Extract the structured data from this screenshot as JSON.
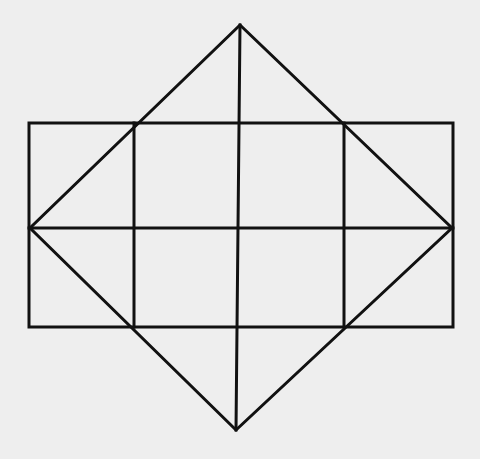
{
  "diagram": {
    "type": "geometric-figure",
    "colors": {
      "background": "#eeeeee",
      "stroke": "#111111"
    },
    "rectangle": {
      "x1": 29,
      "y1": 123,
      "x2": 453,
      "y2": 327
    },
    "grid_verticals": [
      134,
      237,
      344
    ],
    "midline_y": 228,
    "diamond": {
      "top": [
        240,
        25
      ],
      "right": [
        452,
        228
      ],
      "bottom": [
        236,
        430
      ],
      "left": [
        30,
        228
      ]
    },
    "center_vertical": {
      "x_top": 240,
      "y_top": 25,
      "x_bottom": 236,
      "y_bottom": 430
    }
  }
}
